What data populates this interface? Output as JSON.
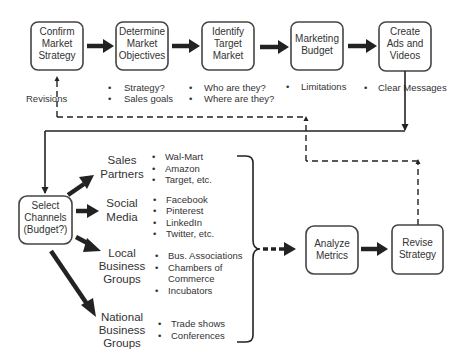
{
  "diagram": {
    "top_flow": [
      {
        "id": "confirm",
        "lines": [
          "Confirm",
          "Market",
          "Strategy"
        ]
      },
      {
        "id": "objectives",
        "lines": [
          "Determine",
          "Market",
          "Objectives"
        ]
      },
      {
        "id": "target",
        "lines": [
          "Identify",
          "Target",
          "Market"
        ]
      },
      {
        "id": "budget",
        "lines": [
          "Marketing",
          "Budget"
        ]
      },
      {
        "id": "ads",
        "lines": [
          "Create",
          "Ads and",
          "Videos"
        ]
      }
    ],
    "top_notes": {
      "confirm": "Revisions",
      "objectives": [
        "Strategy?",
        "Sales goals"
      ],
      "target": [
        "Who are they?",
        "Where are they?"
      ],
      "budget": [
        "Limitations"
      ],
      "ads": [
        "Clear Messages"
      ]
    },
    "select_channels": {
      "lines": [
        "Select",
        "Channels",
        "(Budget?)"
      ]
    },
    "channels": [
      {
        "name": "sales-partners",
        "lines": [
          "Sales",
          "Partners"
        ],
        "items": [
          "Wal-Mart",
          "Amazon",
          "Target, etc."
        ]
      },
      {
        "name": "social-media",
        "lines": [
          "Social",
          "Media"
        ],
        "items": [
          "Facebook",
          "Pinterest",
          "LinkedIn",
          "Twitter, etc."
        ]
      },
      {
        "name": "local-business-groups",
        "lines": [
          "Local",
          "Business",
          "Groups"
        ],
        "items": [
          "Bus. Associations",
          "Chambers of",
          "Commerce",
          "Incubators"
        ]
      },
      {
        "name": "national-business-groups",
        "lines": [
          "National",
          "Business",
          "Groups"
        ],
        "items": [
          "Trade shows",
          "Conferences"
        ]
      }
    ],
    "analyze": {
      "lines": [
        "Analyze",
        "Metrics"
      ]
    },
    "revise": {
      "lines": [
        "Revise",
        "Strategy"
      ]
    },
    "bullet": "•"
  }
}
